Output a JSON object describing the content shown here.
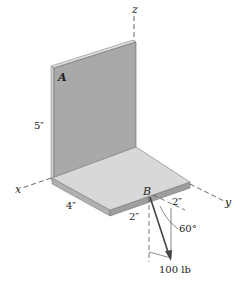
{
  "figure": {
    "axes": {
      "x": "x",
      "y": "y",
      "z": "z"
    },
    "points": {
      "A": "A",
      "B": "B"
    },
    "dimensions": {
      "wall_height": "5″",
      "plate_x_length": "4″",
      "b_offset_front": "2″",
      "b_offset_side": "2″"
    },
    "angle": "60°",
    "force": "100 lb",
    "colors": {
      "wall_face": "#a9a9a9",
      "wall_edge": "#d4d4d4",
      "plate_top": "#d8d8d8",
      "plate_edge": "#9e9e9e",
      "force_arrow": "#444444",
      "lines": "#555555"
    }
  }
}
